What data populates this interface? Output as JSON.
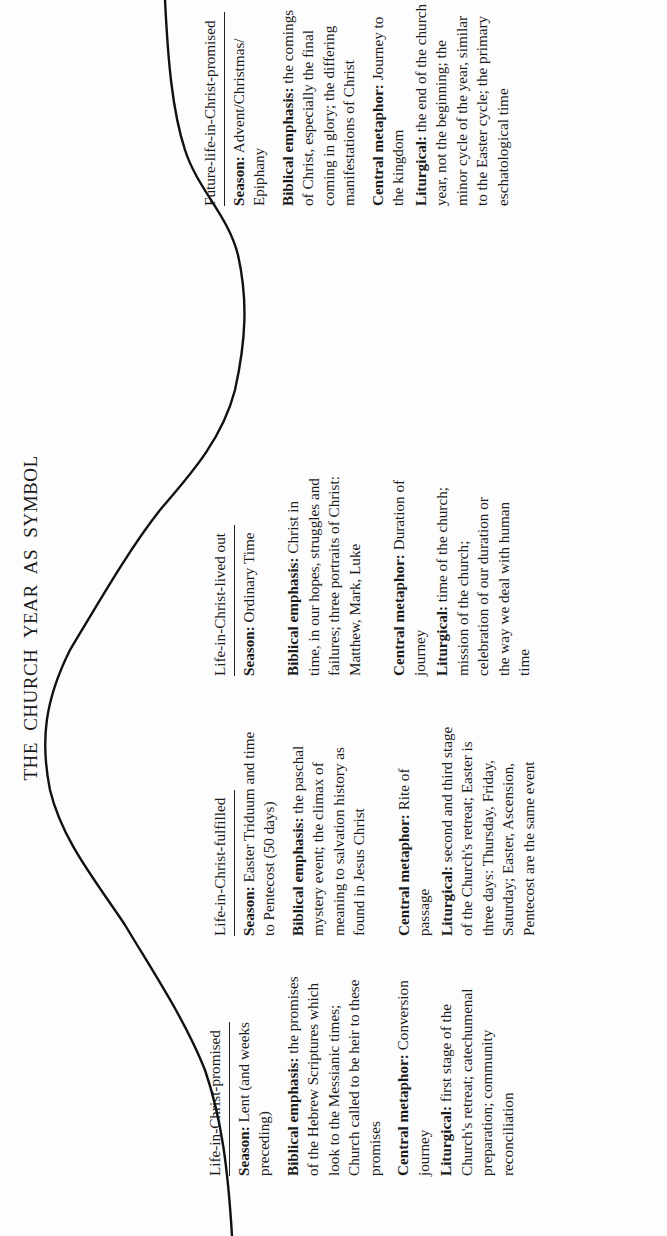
{
  "page": {
    "title": "THE CHURCH YEAR AS SYMBOL",
    "orientation": "rotated 90 degrees counter-clockwise"
  },
  "columns": [
    {
      "heading": "Life-in-Christ-promised",
      "season_label": "Season:",
      "season": "Lent (and weeks preceding)",
      "biblical_label": "Biblical emphasis:",
      "biblical": "the promises of the Hebrew Scriptures which look to the Messianic times; Church called to be heir to these promises",
      "metaphor_label": "Central metaphor:",
      "metaphor": "Conversion journey",
      "liturgical_label": "Liturgical:",
      "liturgical": "first stage of the Church's retreat; catechumenal preparation; community reconciliation"
    },
    {
      "heading": "Life-in-Christ-fulfilled",
      "season_label": "Season:",
      "season": "Easter Triduum and time to Pentecost (50 days)",
      "biblical_label": "Biblical emphasis:",
      "biblical": "the paschal mystery event; the climax of meaning to salvation history as found in Jesus Christ",
      "metaphor_label": "Central metaphor:",
      "metaphor": "Rite of passage",
      "liturgical_label": "Liturgical:",
      "liturgical": "second and third stage of the Church's retreat; Easter is three days: Thursday, Friday, Saturday; Easter, Ascension, Pentecost are the same event"
    },
    {
      "heading": "Life-in-Christ-lived out",
      "season_label": "Season:",
      "season": "Ordinary Time",
      "biblical_label": "Biblical emphasis:",
      "biblical": "Christ in time, in our hopes, struggles and failures; three portraits of Christ: Matthew, Mark, Luke",
      "metaphor_label": "Central metaphor:",
      "metaphor": "Duration of journey",
      "liturgical_label": "Liturgical:",
      "liturgical": "time of the church; mission of the church; celebration of our duration or the way we deal with human time"
    },
    {
      "heading": "Future-life-in-Christ-promised",
      "season_label": "Season:",
      "season": "Advent/Christmas/ Epiphany",
      "biblical_label": "Biblical emphasis:",
      "biblical": "the comings of Christ, especially the final coming in glory; the differing manifestations of Christ",
      "metaphor_label": "Central metaphor:",
      "metaphor": "Journey to the kingdom",
      "liturgical_label": "Liturgical:",
      "liturgical": "the end of the church year, not the beginning; the minor cycle of the year, similar to the Easter cycle; the primary eschatological time"
    }
  ],
  "colors": {
    "ink": "#1a1a1a",
    "paper": "#fdfdfd"
  }
}
